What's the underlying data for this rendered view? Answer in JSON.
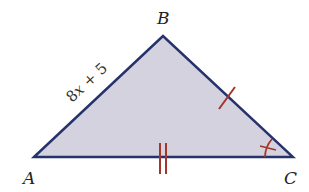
{
  "diagram": {
    "colors": {
      "fill": "#d4d2df",
      "stroke": "#26326b",
      "mark": "#a2362a",
      "text": "#222222"
    },
    "vertices": [
      {
        "label": "A",
        "x": 34,
        "y": 157
      },
      {
        "label": "B",
        "x": 163,
        "y": 36
      },
      {
        "label": "C",
        "x": 293,
        "y": 157
      }
    ],
    "vertex_labels": {
      "A": "A",
      "B": "B",
      "C": "C"
    },
    "side_labels": {
      "AB": {
        "coef": "8",
        "var": "x",
        "rest": " + 5",
        "full": "8x + 5"
      }
    },
    "markings": {
      "BC": "single tick (congruent side mark)",
      "AC": "double tick (congruent side mark)",
      "angle_C": "single angle arc with tick"
    }
  }
}
